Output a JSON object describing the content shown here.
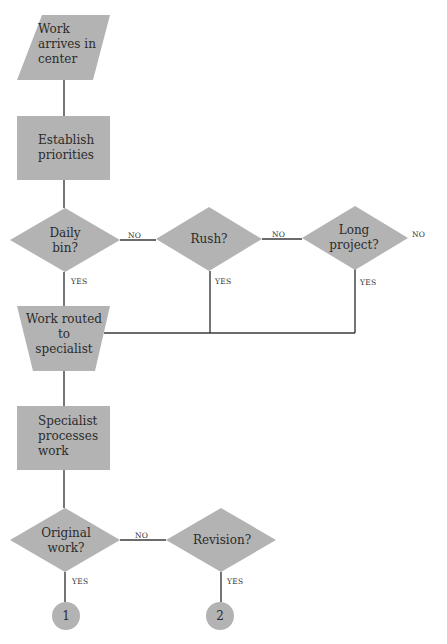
{
  "colors": {
    "shape_fill": "#b3b3b3",
    "line": "#3a3a3a",
    "background": "#ffffff"
  },
  "nodes": {
    "work_arrives": {
      "shape": "parallelogram",
      "lines": [
        "Work",
        "arrives in",
        "center"
      ]
    },
    "establish": {
      "shape": "rectangle",
      "lines": [
        "Establish",
        "priorities"
      ]
    },
    "daily_bin": {
      "shape": "diamond",
      "lines": [
        "Daily",
        "bin?"
      ]
    },
    "rush": {
      "shape": "diamond",
      "lines": [
        "Rush?"
      ]
    },
    "long_project": {
      "shape": "diamond",
      "lines": [
        "Long",
        "project?"
      ]
    },
    "routed": {
      "shape": "trapezoid",
      "lines": [
        "Work routed",
        "to",
        "specialist"
      ]
    },
    "processes": {
      "shape": "rectangle",
      "lines": [
        "Specialist",
        "processes",
        "work"
      ]
    },
    "original": {
      "shape": "diamond",
      "lines": [
        "Original",
        "work?"
      ]
    },
    "revision": {
      "shape": "diamond",
      "lines": [
        "Revision?"
      ]
    },
    "connector_1": {
      "shape": "circle",
      "label": "1"
    },
    "connector_2": {
      "shape": "circle",
      "label": "2"
    }
  },
  "edge_labels": {
    "daily_no": "NO",
    "daily_yes": "YES",
    "rush_no": "NO",
    "rush_yes": "YES",
    "long_no": "NO",
    "long_yes": "YES",
    "original_no": "NO",
    "original_yes": "YES",
    "revision_yes": "YES"
  }
}
